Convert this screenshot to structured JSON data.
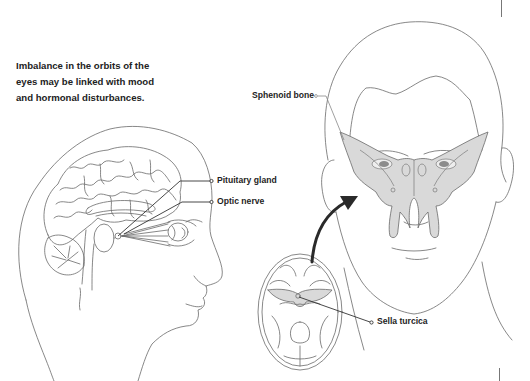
{
  "caption": {
    "line1": "Imbalance in the orbits of the",
    "line2": "eyes may be linked with mood",
    "line3": "and hormonal disturbances."
  },
  "labels": {
    "sphenoid_bone": "Sphenoid bone",
    "pituitary_gland": "Pituitary gland",
    "optic_nerve": "Optic nerve",
    "sella_turcica": "Sella turcica"
  },
  "illustrations": {
    "left": "head-profile-brain-section",
    "right_face": "frontal-face-with-sphenoid-bone",
    "right_skull": "skull-base-cross-section"
  },
  "colors": {
    "line_art": "#5a5a5a",
    "bone_fill": "#d9d9d9",
    "leader_line": "#333333",
    "text": "#222222",
    "arrow": "#2a2a2a"
  }
}
